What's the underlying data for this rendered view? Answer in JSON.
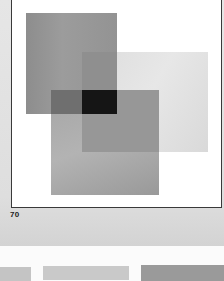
{
  "page": {
    "page_number": "70"
  },
  "plate": {
    "squares": [
      {
        "name": "top-left-square",
        "tone": "medium gray",
        "color": "#959595"
      },
      {
        "name": "right-square",
        "tone": "light gray",
        "color": "#e0e0e0"
      },
      {
        "name": "bottom-square",
        "tone": "medium-light gray",
        "color": "#aaaaaa"
      }
    ],
    "overlap_color": "#151515",
    "frame_color": "#3a3a3a",
    "background_color": "#ffffff"
  },
  "next_page_strips": [
    {
      "color": "#c4c4c4"
    },
    {
      "color": "#c9c9c9"
    },
    {
      "color": "#9a9a9a"
    }
  ]
}
